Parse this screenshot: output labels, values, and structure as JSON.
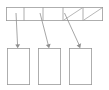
{
  "diagram": {
    "type": "array-of-pointers",
    "canvas": {
      "width": 109,
      "height": 90,
      "background": "#ffffff"
    },
    "style": {
      "stroke_color": "#9a9a9a",
      "stroke_width": 0.8,
      "fill_color": "#ffffff",
      "arrow_color": "#8f8f8f"
    },
    "array": {
      "label": "pointer-array",
      "x": 6,
      "y": 7,
      "width": 97,
      "height": 14,
      "cell_count": 5,
      "cells": [
        {
          "index": 0,
          "x": 6,
          "width": 18,
          "state": "pointer",
          "value": ""
        },
        {
          "index": 1,
          "x": 24,
          "width": 19,
          "state": "pointer",
          "value": ""
        },
        {
          "index": 2,
          "x": 43,
          "width": 20,
          "state": "pointer",
          "value": ""
        },
        {
          "index": 3,
          "x": 63,
          "width": 20,
          "state": "null",
          "value": ""
        },
        {
          "index": 4,
          "x": 83,
          "width": 20,
          "state": "null",
          "value": ""
        }
      ]
    },
    "blocks": [
      {
        "index": 0,
        "label": "block-1",
        "x": 7,
        "y": 48,
        "width": 23,
        "height": 37,
        "value": ""
      },
      {
        "index": 1,
        "label": "block-2",
        "x": 38,
        "y": 48,
        "width": 23,
        "height": 37,
        "value": ""
      },
      {
        "index": 2,
        "label": "block-3",
        "x": 69,
        "y": 48,
        "width": 23,
        "height": 37,
        "value": ""
      }
    ],
    "pointers": [
      {
        "from_cell": 0,
        "to_block": 0,
        "x1": 16,
        "y1": 13,
        "x2": 18,
        "y2": 47
      },
      {
        "from_cell": 1,
        "to_block": 1,
        "x1": 40,
        "y1": 13,
        "x2": 49,
        "y2": 47
      },
      {
        "from_cell": 2,
        "to_block": 2,
        "x1": 67,
        "y1": 13,
        "x2": 80,
        "y2": 47
      }
    ],
    "null_marks": [
      {
        "cell": 3,
        "x1": 64,
        "y1": 20,
        "x2": 82,
        "y2": 8
      },
      {
        "cell": 4,
        "x1": 84,
        "y1": 20,
        "x2": 102,
        "y2": 8
      }
    ]
  }
}
